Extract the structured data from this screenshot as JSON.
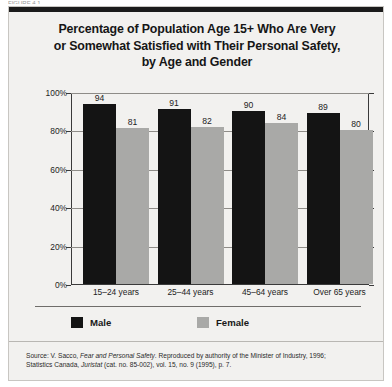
{
  "figure": {
    "header_fragment": "FIGURE 4.1"
  },
  "chart_data": {
    "type": "bar",
    "title": "Percentage of Population Age 15+ Who Are Very or Somewhat Satisfied with Their Personal Safety, by Age and Gender",
    "title_lines": [
      "Percentage of Population Age 15+ Who Are Very",
      "or Somewhat Satisfied with Their Personal Safety,",
      "by Age and Gender"
    ],
    "categories": [
      "15–24 years",
      "25–44 years",
      "45–64 years",
      "Over 65 years"
    ],
    "series": [
      {
        "name": "Male",
        "color": "#141414",
        "values": [
          94,
          91,
          90,
          89
        ]
      },
      {
        "name": "Female",
        "color": "#a9a9a7",
        "values": [
          81,
          82,
          84,
          80
        ]
      }
    ],
    "xlabel": "",
    "ylabel": "",
    "ylim": [
      0,
      100
    ],
    "ytick_labels": [
      "0%",
      "20%",
      "40%",
      "60%",
      "80%",
      "100%"
    ],
    "ytick_values": [
      0,
      20,
      40,
      60,
      80,
      100
    ],
    "grid": true,
    "legend_position": "bottom-left",
    "value_labels": true
  },
  "source": {
    "line1_prefix": "Source: V. Sacco, ",
    "line1_italic": "Fear and Personal Safety",
    "line1_suffix": ". Reproduced by authority of the Minister of Industry, 1996;",
    "line2_prefix": "Statistics Canada, ",
    "line2_italic": "Juristat",
    "line2_suffix": " (cat. no. 85-002), vol. 15, no. 9 (1995), p. 7."
  }
}
